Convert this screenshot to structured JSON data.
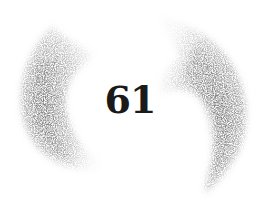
{
  "page": {
    "number": "61"
  },
  "ornament": {
    "left_bracket": "brush-crescent-left",
    "right_bracket": "brush-crescent-right",
    "stroke_color": "#7a7a7a",
    "background": "#ffffff",
    "number_color": "#1a1a1a"
  }
}
